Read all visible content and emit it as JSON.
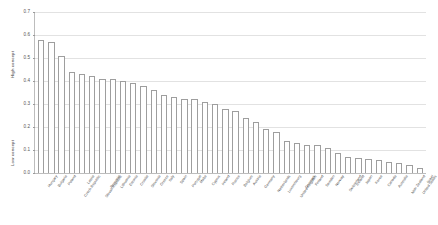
{
  "chart_data": {
    "type": "bar",
    "title": "",
    "subtitle": "",
    "xlabel": "",
    "ylabel": "",
    "ylim": [
      0.0,
      0.7
    ],
    "ytick_labels": [
      "0.0",
      "0.1",
      "0.2",
      "0.3",
      "0.4",
      "0.5",
      "0.6",
      "0.7"
    ],
    "ytick_values": [
      0.0,
      0.1,
      0.2,
      0.3,
      0.4,
      0.5,
      0.6,
      0.7
    ],
    "grid": true,
    "legend": "none",
    "axis_group_labels": {
      "high": "High concept",
      "low": "Low concept"
    },
    "bar_style": {
      "fill": "#ffffff",
      "edge": "#9e9e9e"
    },
    "categories": [
      "Hungary",
      "Bulgaria",
      "Poland",
      "Czech Republic",
      "Latvia",
      "Slovak Republic",
      "Romania",
      "Lithuania",
      "Estonia",
      "Croatia",
      "Slovenia",
      "Greece",
      "Italy",
      "Spain",
      "Portugal",
      "Malta",
      "Cyprus",
      "Ireland",
      "France",
      "Belgium",
      "Austria",
      "Germany",
      "Netherlands",
      "Luxembourg",
      "United Kingdom",
      "Denmark",
      "Finland",
      "Sweden",
      "Norway",
      "Switzerland",
      "Iceland",
      "Japan",
      "Korea",
      "Canada",
      "Australia",
      "New Zealand",
      "United States",
      "Israel"
    ],
    "values": [
      0.58,
      0.57,
      0.51,
      0.44,
      0.43,
      0.42,
      0.41,
      0.41,
      0.4,
      0.39,
      0.38,
      0.36,
      0.34,
      0.33,
      0.32,
      0.32,
      0.31,
      0.3,
      0.28,
      0.27,
      0.24,
      0.22,
      0.19,
      0.18,
      0.14,
      0.13,
      0.12,
      0.12,
      0.11,
      0.085,
      0.07,
      0.065,
      0.06,
      0.055,
      0.05,
      0.045,
      0.035,
      0.02
    ]
  }
}
